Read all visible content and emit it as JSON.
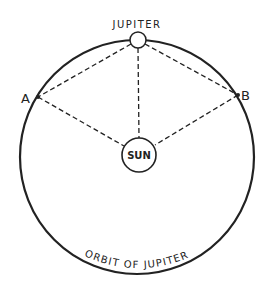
{
  "diagram": {
    "title_label": "JUPITER",
    "sun_label": "SUN",
    "point_a_label": "A",
    "point_b_label": "B",
    "orbit_label": "ORBIT OF JUPITER",
    "colors": {
      "line": "#222222",
      "background": "#ffffff"
    }
  }
}
